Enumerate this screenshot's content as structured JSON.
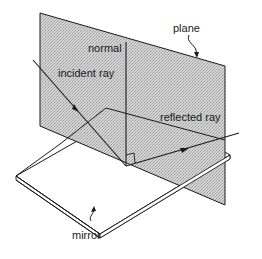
{
  "diagram": {
    "labels": {
      "plane": "plane",
      "normal": "normal",
      "incident_ray": "incident ray",
      "reflected_ray": "reflected ray",
      "mirror": "mirror"
    },
    "colors": {
      "plane_fill": "#c8c8c8",
      "line": "#1a1a1a",
      "mirror_fill": "#ffffff",
      "background": "#ffffff"
    }
  }
}
